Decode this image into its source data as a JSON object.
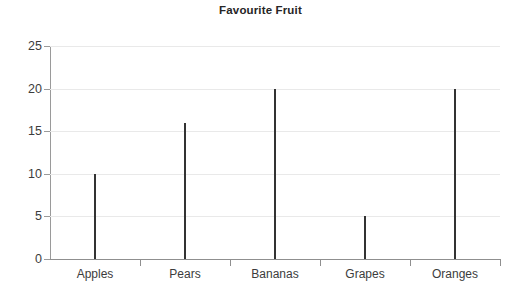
{
  "chart_data": {
    "type": "bar",
    "title": "Favourite Fruit",
    "xlabel": "",
    "ylabel": "me",
    "categories": [
      "Apples",
      "Pears",
      "Bananas",
      "Grapes",
      "Oranges"
    ],
    "values": [
      10,
      16,
      20,
      5,
      20
    ],
    "ylim": [
      0,
      25
    ],
    "yticks": [
      0,
      5,
      10,
      15,
      20,
      25
    ],
    "ytick_labels": [
      "0",
      "5",
      "10",
      "15",
      "20",
      "25"
    ],
    "grid": true,
    "legend": false,
    "series": [
      {
        "name": "Favourite Fruit",
        "values": [
          10,
          16,
          20,
          5,
          20
        ]
      }
    ],
    "bar_color": "#333333",
    "gridline_color": "#e9e9e9",
    "axis_color": "#8f8f8f",
    "background_color": "#ffffff"
  },
  "axis_caption_clipped": "me",
  "clipped_left_glyph": "r"
}
